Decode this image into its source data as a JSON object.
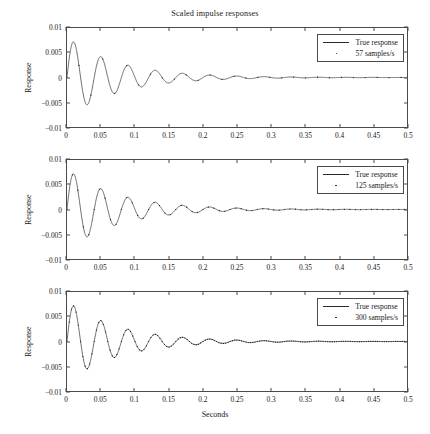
{
  "chart_data": {
    "type": "line",
    "title": "Scaled impulse responses",
    "xlabel": "Seconds",
    "ylabel": "Response",
    "xlim": [
      0,
      0.5
    ],
    "ylim": [
      -0.01,
      0.01
    ],
    "xticks": [
      "0",
      "0.05",
      "0.1",
      "0.15",
      "0.2",
      "0.25",
      "0.3",
      "0.35",
      "0.4",
      "0.45",
      "0.5"
    ],
    "xtick_values": [
      0,
      0.05,
      0.1,
      0.15,
      0.2,
      0.25,
      0.3,
      0.35,
      0.4,
      0.45,
      0.5
    ],
    "yticks": [
      "0.01",
      "0.005",
      "0",
      "−0.005",
      "−0.01"
    ],
    "ytick_values": [
      0.01,
      0.005,
      0,
      -0.005,
      -0.01
    ],
    "grid": false,
    "legend_position": "upper right",
    "line_color": "#2a2a2a",
    "marker_color": "#1a1a1a",
    "axis_color": "#4a4a4a",
    "waveform": {
      "description": "Damped sinusoidal impulse response, identical in all three panels",
      "model": "A * exp(-t/tau) * sin(2*pi*f*t)",
      "amplitude": 0.0082,
      "frequency_hz": 25.0,
      "decay_tau_s": 0.075,
      "first_peak": {
        "t": 0.011,
        "y": 0.0058
      },
      "first_trough": {
        "t": 0.031,
        "y": -0.0048
      },
      "second_peak": {
        "t": 0.049,
        "y": 0.0039
      },
      "second_trough": {
        "t": 0.069,
        "y": -0.0033
      },
      "third_peak": {
        "t": 0.089,
        "y": 0.0025
      },
      "period_s": 0.04
    },
    "panels": [
      {
        "index": 1,
        "sample_rate_hz": 57,
        "series": [
          {
            "name": "True response",
            "style": "line"
          },
          {
            "name": "57 samples/s",
            "style": "dots"
          }
        ]
      },
      {
        "index": 2,
        "sample_rate_hz": 125,
        "series": [
          {
            "name": "True response",
            "style": "line"
          },
          {
            "name": "125 samples/s",
            "style": "dots"
          }
        ]
      },
      {
        "index": 3,
        "sample_rate_hz": 300,
        "series": [
          {
            "name": "True response",
            "style": "line"
          },
          {
            "name": "300 samples/s",
            "style": "dots"
          }
        ]
      }
    ]
  },
  "figure": {
    "title": "Scaled impulse responses",
    "xlabel": "Seconds",
    "panels": [
      {
        "ylabel": "Response",
        "legend": {
          "true_label": "True response",
          "sample_label": "57 samples/s"
        }
      },
      {
        "ylabel": "Response",
        "legend": {
          "true_label": "True response",
          "sample_label": "125 samples/s"
        }
      },
      {
        "ylabel": "Response",
        "legend": {
          "true_label": "True response",
          "sample_label": "300 samples/s"
        }
      }
    ]
  }
}
